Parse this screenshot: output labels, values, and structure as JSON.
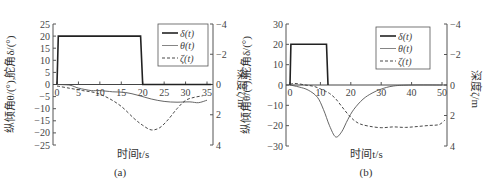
{
  "chart_data": [
    {
      "panel": "(a)",
      "type": "line",
      "xlabel": "时间t/s",
      "ylabel": "纵倾角θ/(°),舵角δ/(°)",
      "y2label": "深度ζ/m",
      "xlim": [
        -1,
        36
      ],
      "ylim": [
        -25,
        25
      ],
      "y2lim": [
        4,
        -4
      ],
      "xticks": [
        0,
        5,
        10,
        15,
        20,
        25,
        30,
        35
      ],
      "yticks": [
        25,
        20,
        15,
        10,
        5,
        0,
        -5,
        -10,
        -15,
        -20,
        -25
      ],
      "y2ticks": [
        -4,
        -2,
        0,
        2,
        4
      ],
      "legend": [
        "δ(t)",
        "θ(t)",
        "ζ(t)"
      ],
      "legend_position": "upper right",
      "grid": false,
      "series": [
        {
          "name": "δ(t)",
          "axis": "left",
          "style": "solid-thick",
          "x": [
            0,
            0.3,
            19.5,
            20,
            36
          ],
          "y": [
            0,
            20,
            20,
            0,
            0
          ]
        },
        {
          "name": "θ(t)",
          "axis": "left",
          "style": "solid-thin",
          "x": [
            0,
            3,
            5,
            8,
            10,
            13,
            16,
            19,
            22,
            25,
            28,
            31,
            33,
            35
          ],
          "y": [
            0,
            -0.3,
            -1.5,
            -2.5,
            -2.5,
            -3,
            -3.3,
            -4.5,
            -6,
            -7,
            -7.3,
            -7.2,
            -7.5,
            -6.5
          ]
        },
        {
          "name": "ζ(t)",
          "axis": "right",
          "style": "dashed",
          "x": [
            0,
            3,
            6,
            9,
            12,
            15,
            18,
            20,
            22,
            24,
            26,
            28,
            30,
            32,
            34
          ],
          "y": [
            0.1,
            0.25,
            0.4,
            0.55,
            0.9,
            1.45,
            2.25,
            2.7,
            3.0,
            2.85,
            2.3,
            1.6,
            1.05,
            0.85,
            0.75
          ]
        }
      ]
    },
    {
      "panel": "(b)",
      "type": "line",
      "xlabel": "时间t/s",
      "ylabel": "纵倾角θ/(°),舵角δ/(°)",
      "y2label": "深度ζ/m",
      "xlim": [
        -1,
        52
      ],
      "ylim": [
        -30,
        30
      ],
      "y2lim": [
        4,
        -4
      ],
      "xticks": [
        0,
        10,
        20,
        30,
        40,
        50
      ],
      "yticks": [
        30,
        20,
        10,
        0,
        -10,
        -20,
        -30
      ],
      "y2ticks": [
        -4,
        -2,
        0,
        2,
        4
      ],
      "legend": [
        "δ(t)",
        "θ(t)",
        "ζ(t)"
      ],
      "legend_position": "upper right",
      "grid": false,
      "series": [
        {
          "name": "δ(t)",
          "axis": "left",
          "style": "solid-thick",
          "x": [
            0,
            0.3,
            12,
            12.5,
            52
          ],
          "y": [
            0,
            20,
            20,
            0,
            0
          ]
        },
        {
          "name": "θ(t)",
          "axis": "left",
          "style": "solid-thin",
          "x": [
            0,
            3,
            6,
            9,
            11,
            13,
            15,
            17,
            19,
            21,
            24,
            27,
            30,
            34,
            40,
            50
          ],
          "y": [
            0,
            -1,
            -2.5,
            -6,
            -12,
            -20,
            -25.5,
            -23,
            -17,
            -12,
            -7,
            -4,
            -2,
            -0.5,
            0,
            0
          ]
        },
        {
          "name": "ζ(t)",
          "axis": "right",
          "style": "dashed",
          "x": [
            0,
            2,
            5,
            8,
            11,
            13,
            15,
            17,
            19,
            21,
            23,
            26,
            30,
            34,
            38,
            42,
            46,
            49,
            51
          ],
          "y": [
            -0.05,
            -0.1,
            0,
            0.1,
            0.35,
            0.55,
            0.9,
            1.4,
            1.9,
            2.3,
            2.55,
            2.7,
            2.8,
            2.75,
            2.78,
            2.72,
            2.65,
            2.6,
            2.3
          ]
        }
      ]
    }
  ],
  "panels": [
    {
      "caption": "(a)",
      "xlabel": "时间t/s",
      "ylabel": "纵倾角θ/(°),舵角δ/(°)",
      "y2label": "深度ζ/m",
      "legend": [
        "δ(t)",
        "θ(t)",
        "ζ(t)"
      ]
    },
    {
      "caption": "(b)",
      "xlabel": "时间t/s",
      "ylabel": "纵倾角θ/(°),舵角δ/(°)",
      "y2label": "深度ζ/m",
      "legend": [
        "δ(t)",
        "θ(t)",
        "ζ(t)"
      ]
    }
  ]
}
